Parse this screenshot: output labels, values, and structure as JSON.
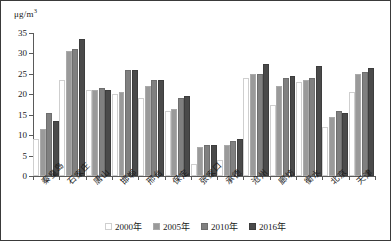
{
  "chart_data": {
    "type": "bar",
    "title": "",
    "subtitle": "",
    "xlabel": "",
    "ylabel": "μg/m³",
    "ylim": [
      0,
      35
    ],
    "yticks": [
      0,
      5,
      10,
      15,
      20,
      25,
      30,
      35
    ],
    "ytick_labels": [
      "0",
      "5",
      "10",
      "15",
      "20",
      "25",
      "30",
      "35"
    ],
    "grid": false,
    "legend_position": "bottom",
    "categories": [
      "秦皇岛",
      "石家庄",
      "唐山",
      "邯郸",
      "邢台",
      "保定",
      "张家口",
      "承德",
      "沧州",
      "廊坊",
      "衡水",
      "北京",
      "天津"
    ],
    "series": [
      {
        "name": "2000年",
        "color": "#d2d2d2",
        "values": [
          8.5,
          23.0,
          20.5,
          19.5,
          18.5,
          15.5,
          2.5,
          3.5,
          23.5,
          17.0,
          22.5,
          11.5,
          20.0
        ]
      },
      {
        "name": "2005年",
        "color": "#9a9a9a",
        "values": [
          11.0,
          30.0,
          20.5,
          20.0,
          21.5,
          16.0,
          6.5,
          7.0,
          24.5,
          21.5,
          23.0,
          14.0,
          24.5
        ]
      },
      {
        "name": "2010年",
        "color": "#808080",
        "values": [
          15.0,
          30.5,
          21.0,
          25.5,
          23.0,
          18.5,
          7.0,
          8.0,
          24.5,
          23.5,
          23.5,
          15.5,
          25.0
        ]
      },
      {
        "name": "2016年",
        "color": "#4a4a4a",
        "values": [
          13.0,
          33.0,
          20.5,
          25.5,
          23.0,
          19.0,
          7.0,
          8.5,
          27.0,
          24.0,
          26.5,
          15.0,
          26.0
        ]
      }
    ]
  },
  "axis": {
    "unit_text": "μg/m",
    "unit_sup": "3"
  },
  "legend": {
    "items": [
      {
        "label": "2000年"
      },
      {
        "label": "2005年"
      },
      {
        "label": "2010年"
      },
      {
        "label": "2016年"
      }
    ]
  }
}
